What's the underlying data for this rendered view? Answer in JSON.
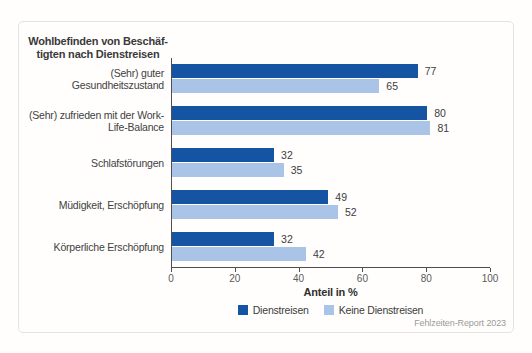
{
  "chart_data": {
    "type": "bar",
    "orientation": "horizontal",
    "title_lines": [
      "Wohlbefinden von Beschäf-",
      "tigten nach Dienstreisen"
    ],
    "categories": [
      "(Sehr) guter Gesundheitszustand",
      "(Sehr) zufrieden mit der Work-Life-Balance",
      "Schlafstörungen",
      "Müdigkeit, Erschöpfung",
      "Körperliche Erschöpfung"
    ],
    "category_lines": [
      [
        "(Sehr) guter",
        "Gesundheitszustand"
      ],
      [
        "(Sehr) zufrieden mit der Work-",
        "Life-Balance"
      ],
      [
        "Schlafstörungen"
      ],
      [
        "Müdigkeit, Erschöpfung"
      ],
      [
        "Körperliche Erschöpfung"
      ]
    ],
    "series": [
      {
        "name": "Dienstreisen",
        "color": "#1554a3",
        "values": [
          77,
          80,
          32,
          49,
          32
        ]
      },
      {
        "name": "Keine Dienstreisen",
        "color": "#a9c4e6",
        "values": [
          65,
          81,
          35,
          52,
          42
        ]
      }
    ],
    "xlabel": "Anteil in %",
    "xlim": [
      0,
      100
    ],
    "xticks": [
      0,
      20,
      40,
      60,
      80,
      100
    ],
    "legend_position": "bottom",
    "grid": false,
    "source": "Fehlzeiten-Report 2023"
  }
}
